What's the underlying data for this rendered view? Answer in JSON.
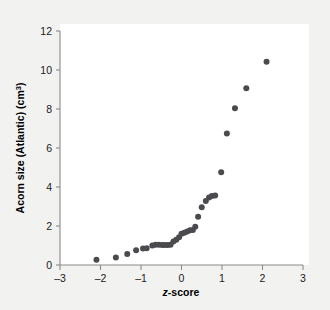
{
  "chart_data": {
    "type": "scatter",
    "title": "",
    "subtitle": "",
    "xlabel": "z-score",
    "xlabel_italic_prefix": "z",
    "xlabel_rest": "-score",
    "ylabel": "Acorn size (Atlantic) (cm³)",
    "ylabel_main": "Acorn size (Atlantic) (cm",
    "ylabel_exponent": "3",
    "ylabel_tail": ")",
    "xlim": [
      -3,
      3
    ],
    "ylim": [
      0,
      12
    ],
    "xticks": [
      -3,
      -2,
      -1,
      0,
      1,
      2,
      3
    ],
    "xtick_labels": [
      "–3",
      "–2",
      "–1",
      "0",
      "1",
      "2",
      "3"
    ],
    "yticks": [
      0,
      2,
      4,
      6,
      8,
      10,
      12
    ],
    "ytick_labels": [
      "0",
      "2",
      "4",
      "6",
      "8",
      "10",
      "12"
    ],
    "grid": false,
    "legend": null,
    "marker_color": "#4a4a4f",
    "marker_size": 3.0,
    "plot_background": "#ffffff",
    "figure_background": "#f2f2f0",
    "axis_color": "#8a8a8a",
    "n_points": 34,
    "points": [
      {
        "x": -2.1,
        "y": 0.27
      },
      {
        "x": -1.62,
        "y": 0.38
      },
      {
        "x": -1.34,
        "y": 0.57
      },
      {
        "x": -1.12,
        "y": 0.76
      },
      {
        "x": -0.95,
        "y": 0.84
      },
      {
        "x": -0.86,
        "y": 0.86
      },
      {
        "x": -0.72,
        "y": 1.0
      },
      {
        "x": -0.64,
        "y": 1.04
      },
      {
        "x": -0.56,
        "y": 1.04
      },
      {
        "x": -0.48,
        "y": 1.02
      },
      {
        "x": -0.41,
        "y": 1.02
      },
      {
        "x": -0.34,
        "y": 1.02
      },
      {
        "x": -0.27,
        "y": 1.04
      },
      {
        "x": -0.2,
        "y": 1.2
      },
      {
        "x": -0.13,
        "y": 1.3
      },
      {
        "x": -0.06,
        "y": 1.42
      },
      {
        "x": 0.0,
        "y": 1.6
      },
      {
        "x": 0.07,
        "y": 1.66
      },
      {
        "x": 0.14,
        "y": 1.72
      },
      {
        "x": 0.21,
        "y": 1.78
      },
      {
        "x": 0.28,
        "y": 1.8
      },
      {
        "x": 0.34,
        "y": 1.96
      },
      {
        "x": 0.41,
        "y": 2.48
      },
      {
        "x": 0.5,
        "y": 2.96
      },
      {
        "x": 0.6,
        "y": 3.28
      },
      {
        "x": 0.68,
        "y": 3.46
      },
      {
        "x": 0.75,
        "y": 3.54
      },
      {
        "x": 0.83,
        "y": 3.56
      },
      {
        "x": 0.98,
        "y": 4.76
      },
      {
        "x": 1.12,
        "y": 6.74
      },
      {
        "x": 1.32,
        "y": 8.04
      },
      {
        "x": 1.6,
        "y": 9.06
      },
      {
        "x": 2.1,
        "y": 10.42
      }
    ]
  }
}
